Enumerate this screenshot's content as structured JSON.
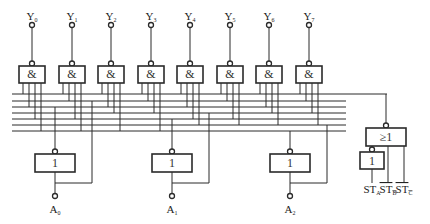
{
  "diagram": {
    "outputs": [
      {
        "name": "Y",
        "sub": "0"
      },
      {
        "name": "Y",
        "sub": "1"
      },
      {
        "name": "Y",
        "sub": "2"
      },
      {
        "name": "Y",
        "sub": "3"
      },
      {
        "name": "Y",
        "sub": "4"
      },
      {
        "name": "Y",
        "sub": "5"
      },
      {
        "name": "Y",
        "sub": "6"
      },
      {
        "name": "Y",
        "sub": "7"
      }
    ],
    "and_gate_symbol": "&",
    "inverter_symbol": "1",
    "or_gate_symbol": "≥1",
    "address_inputs": [
      {
        "name": "A",
        "sub": "0"
      },
      {
        "name": "A",
        "sub": "1"
      },
      {
        "name": "A",
        "sub": "2"
      }
    ],
    "enable_inputs": [
      {
        "name": "ST",
        "sub": "A",
        "overline": false
      },
      {
        "name": "ST",
        "sub": "B",
        "overline": true
      },
      {
        "name": "ST",
        "sub": "C",
        "overline": true
      }
    ]
  }
}
